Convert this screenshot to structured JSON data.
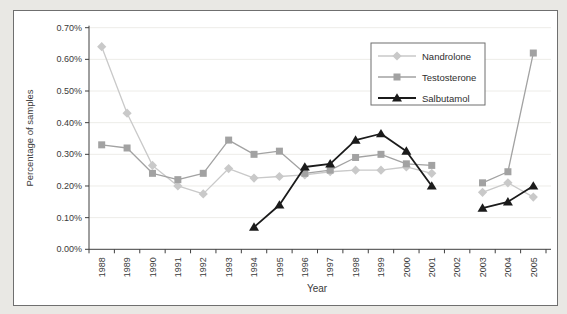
{
  "figure": {
    "background_color": "#e9e8e4",
    "frame_border_color": "#6f6f6f",
    "plot_background": "#ffffff"
  },
  "chart_data": {
    "type": "line",
    "title": "",
    "xlabel": "Year",
    "ylabel": "Percentage of samples",
    "categories": [
      "1988",
      "1989",
      "1990",
      "1991",
      "1992",
      "1993",
      "1994",
      "1995",
      "1996",
      "1997",
      "1998",
      "1999",
      "2000",
      "2001",
      "2002",
      "2003",
      "2004",
      "2005"
    ],
    "ylim": [
      0,
      0.7
    ],
    "y_tick_step": 0.1,
    "y_tick_labels": [
      "0.00%",
      "0.10%",
      "0.20%",
      "0.30%",
      "0.40%",
      "0.50%",
      "0.60%",
      "0.70%"
    ],
    "grid": true,
    "legend_position": "inside-upper-right",
    "axis_color": "#3f3f3f",
    "grid_color": "#edece8",
    "series": [
      {
        "name": "Nandrolone",
        "marker": "diamond",
        "color": "#c9c9c9",
        "line_width": 1.3,
        "values": [
          0.64,
          0.43,
          0.265,
          0.2,
          0.175,
          0.255,
          0.225,
          0.23,
          0.235,
          0.245,
          0.25,
          0.25,
          0.26,
          0.24,
          null,
          0.18,
          0.21,
          0.165
        ]
      },
      {
        "name": "Testosterone",
        "marker": "square",
        "color": "#a2a2a2",
        "line_width": 1.3,
        "values": [
          0.33,
          0.32,
          0.24,
          0.22,
          0.24,
          0.345,
          0.3,
          0.31,
          0.24,
          0.25,
          0.29,
          0.3,
          0.27,
          0.265,
          null,
          0.21,
          0.245,
          0.62
        ]
      },
      {
        "name": "Salbutamol",
        "marker": "triangle",
        "color": "#1b1b1b",
        "line_width": 1.8,
        "values": [
          null,
          null,
          null,
          null,
          null,
          null,
          0.07,
          0.14,
          0.26,
          0.27,
          0.345,
          0.365,
          0.31,
          0.2,
          null,
          0.13,
          0.15,
          0.2
        ]
      }
    ]
  }
}
